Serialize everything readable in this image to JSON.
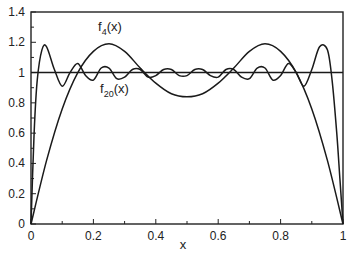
{
  "chart_data": {
    "type": "line",
    "title": "",
    "xlabel": "x",
    "ylabel": "",
    "xlim": [
      0,
      1
    ],
    "ylim": [
      0,
      1.4
    ],
    "xticks": [
      "0",
      "0.2",
      "0.4",
      "0.6",
      "0.8",
      "1"
    ],
    "yticks": [
      "0",
      "0.2",
      "0.4",
      "0.6",
      "0.8",
      "1",
      "1.2",
      "1.4"
    ],
    "grid": false,
    "legend": "none (inline curve labels)",
    "annotations": [
      {
        "text": "f4(x)",
        "base": "f",
        "sub": "4",
        "suffix": "(x)",
        "x": 0.25,
        "y": 1.3
      },
      {
        "text": "f20(x)",
        "base": "f",
        "sub": "20",
        "suffix": "(x)",
        "x": 0.25,
        "y": 0.93
      }
    ],
    "series": [
      {
        "name": "constant 1",
        "x": [
          0,
          1
        ],
        "y": [
          1,
          1
        ]
      },
      {
        "name": "f4(x)",
        "x": [
          0,
          0.05,
          0.1,
          0.15,
          0.2,
          0.25,
          0.3,
          0.35,
          0.4,
          0.45,
          0.5,
          0.55,
          0.6,
          0.65,
          0.7,
          0.75,
          0.8,
          0.85,
          0.9,
          0.95,
          1
        ],
        "y": [
          0,
          0.42,
          0.76,
          1.0,
          1.14,
          1.19,
          1.14,
          1.03,
          0.93,
          0.86,
          0.84,
          0.86,
          0.93,
          1.03,
          1.14,
          1.19,
          1.14,
          1.0,
          0.76,
          0.42,
          0
        ]
      },
      {
        "name": "f20(x)",
        "x": [
          0,
          0.01,
          0.02,
          0.035,
          0.05,
          0.075,
          0.1,
          0.125,
          0.15,
          0.175,
          0.2,
          0.225,
          0.25,
          0.275,
          0.3,
          0.325,
          0.35,
          0.375,
          0.4,
          0.425,
          0.45,
          0.475,
          0.5,
          0.525,
          0.55,
          0.575,
          0.6,
          0.625,
          0.65,
          0.675,
          0.7,
          0.725,
          0.75,
          0.775,
          0.8,
          0.825,
          0.85,
          0.875,
          0.9,
          0.925,
          0.95,
          0.965,
          0.98,
          0.99,
          1
        ],
        "y": [
          0,
          0.6,
          0.95,
          1.15,
          1.17,
          1.02,
          0.91,
          1.0,
          1.06,
          0.98,
          0.95,
          1.03,
          1.03,
          0.96,
          0.97,
          1.02,
          1.02,
          0.97,
          0.98,
          1.02,
          1.02,
          0.98,
          0.98,
          1.02,
          1.02,
          0.98,
          0.97,
          1.02,
          1.02,
          0.97,
          0.96,
          1.03,
          1.03,
          0.95,
          0.98,
          1.06,
          1.0,
          0.91,
          1.02,
          1.17,
          1.15,
          0.95,
          0.6,
          0.3,
          0
        ]
      }
    ]
  }
}
